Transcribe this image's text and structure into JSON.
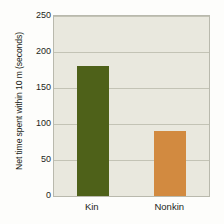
{
  "chart_data": {
    "type": "bar",
    "title": "",
    "xlabel": "",
    "ylabel": "Net time spent within 10 m (seconds)",
    "categories": [
      "Kin",
      "Nonkin"
    ],
    "values": [
      180,
      90
    ],
    "series": [
      {
        "name": "Net time spent within 10 m",
        "values": [
          180,
          90
        ],
        "colors": [
          "#4e6119",
          "#d28a40"
        ]
      }
    ],
    "ylim": [
      0,
      250
    ],
    "yticks": [
      0,
      50,
      100,
      150,
      200,
      250
    ],
    "ytick_labels": [
      "0",
      "50",
      "100",
      "150",
      "200",
      "250"
    ],
    "grid": true,
    "grid_axis": "y",
    "legend": "none",
    "bar_colors": {
      "kin": "#4e6119",
      "nonkin": "#d28a40"
    },
    "plot_background": "#e9e8de",
    "figure_background": "#fdfdfb"
  }
}
